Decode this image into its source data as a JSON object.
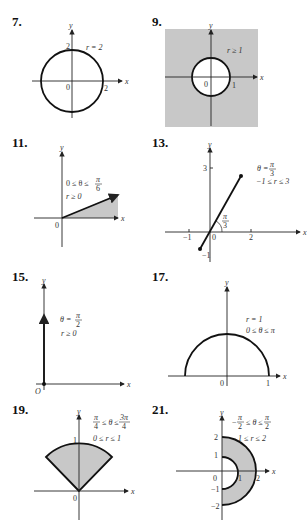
{
  "problems": [
    {
      "number": "7.",
      "description": "Circle centered at origin",
      "labels": {
        "curve": "r = 2",
        "origin": "0",
        "x_tick": "2",
        "y_tick": "2",
        "x_axis": "x",
        "y_axis": "y"
      }
    },
    {
      "number": "9.",
      "description": "Region outside unit circle (shaded)",
      "labels": {
        "curve": "r ≥ 1",
        "origin": "0",
        "x_tick": "1",
        "x_axis": "x",
        "y_axis": "y"
      },
      "shade_color": "#c8c8c8"
    },
    {
      "number": "11.",
      "description": "Wedge from angle 0 to π/6",
      "labels": {
        "cond1": "0 ≤ θ ≤ ",
        "cond1_num": "π",
        "cond1_den": "6",
        "cond2": "r ≥ 0",
        "origin": "0",
        "x_axis": "x",
        "y_axis": "y"
      }
    },
    {
      "number": "13.",
      "description": "Line segment at θ = π/3",
      "labels": {
        "cond1": "θ = ",
        "cond1_num": "π",
        "cond1_den": "3",
        "cond2": "−1 ≤ r ≤ 3",
        "angle_num": "π",
        "angle_den": "3",
        "origin": "0",
        "x_ticks": [
          "−1",
          "2"
        ],
        "y_ticks": [
          "3",
          "−1"
        ],
        "x_axis": "x",
        "y_axis": "y"
      }
    },
    {
      "number": "15.",
      "description": "Ray along positive y-axis",
      "labels": {
        "cond1": "θ = ",
        "cond1_num": "π",
        "cond1_den": "2",
        "cond2": "r ≥ 0",
        "origin": "O",
        "x_axis": "x",
        "y_axis": "y"
      }
    },
    {
      "number": "17.",
      "description": "Upper semicircle",
      "labels": {
        "cond1": "r = 1",
        "cond2": "0 ≤ θ ≤ π",
        "origin": "0",
        "x_tick": "1",
        "x_axis": "x",
        "y_axis": "y"
      }
    },
    {
      "number": "19.",
      "description": "Sector from π/4 to 3π/4",
      "labels": {
        "cond1_a_num": "π",
        "cond1_a_den": "4",
        "cond1_mid": " ≤ θ ≤ ",
        "cond1_b_num": "3π",
        "cond1_b_den": "4",
        "cond2": "0 ≤ r ≤ 1",
        "origin": "0",
        "y_tick": "1",
        "x_axis": "x",
        "y_axis": "y"
      }
    },
    {
      "number": "21.",
      "description": "Right half annulus",
      "labels": {
        "cond1_a_num": "π",
        "cond1_a_den": "2",
        "cond1_mid": " ≤ θ ≤ ",
        "cond1_b_num": "π",
        "cond1_b_den": "2",
        "cond1_minus": "−",
        "cond2": "1 ≤ r ≤ 2",
        "origin": "0",
        "x_ticks": [
          "1",
          "2"
        ],
        "y_ticks": [
          "2",
          "1",
          "−1",
          "−2"
        ],
        "x_axis": "x",
        "y_axis": "y"
      }
    }
  ],
  "colors": {
    "shade": "#c8c8c8",
    "ink": "#111111"
  }
}
